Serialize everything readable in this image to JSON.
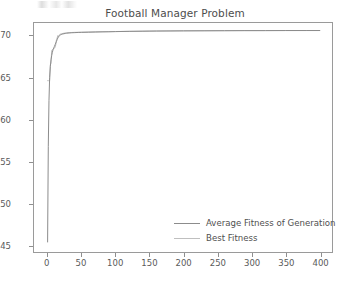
{
  "chart_data": {
    "type": "line",
    "title": "Football Manager Problem",
    "xlabel": "",
    "ylabel": "",
    "xlim": [
      -20,
      418
    ],
    "ylim": [
      44.2,
      71.6
    ],
    "xticks": [
      0,
      50,
      100,
      150,
      200,
      250,
      300,
      350,
      400
    ],
    "yticks": [
      45,
      50,
      55,
      60,
      65,
      70
    ],
    "grid": false,
    "legend_position": "lower right",
    "series": [
      {
        "name": "Average Fitness of Generation",
        "color": "#8c8c8c",
        "x": [
          0,
          1,
          2,
          3,
          4,
          5,
          6,
          7,
          8,
          9,
          10,
          11,
          12,
          13,
          14,
          15,
          16,
          17,
          18,
          19,
          20,
          22,
          24,
          26,
          28,
          30,
          35,
          40,
          45,
          50,
          60,
          70,
          80,
          90,
          100,
          120,
          140,
          160,
          180,
          200,
          230,
          260,
          290,
          320,
          350,
          380,
          400
        ],
        "values": [
          45.4,
          56.8,
          62.3,
          65.1,
          66.4,
          67.2,
          67.7,
          68.1,
          68.4,
          68.6,
          68.8,
          69.0,
          69.2,
          69.4,
          69.6,
          69.8,
          69.95,
          70.05,
          70.12,
          70.18,
          70.22,
          70.28,
          70.32,
          70.35,
          70.38,
          70.4,
          70.43,
          70.45,
          70.47,
          70.48,
          70.5,
          70.52,
          70.54,
          70.55,
          70.57,
          70.6,
          70.62,
          70.64,
          70.65,
          70.66,
          70.67,
          70.68,
          70.69,
          70.69,
          70.7,
          70.7,
          70.7
        ]
      },
      {
        "name": "Best Fitness",
        "color": "#bfbfbf",
        "x": [
          0,
          1,
          2,
          3,
          4,
          5,
          6,
          7,
          8,
          9,
          10,
          11,
          12,
          13,
          14,
          15,
          16,
          17,
          18,
          20,
          24,
          28,
          32,
          40,
          50,
          70,
          100,
          150,
          200,
          260,
          320,
          400
        ],
        "values": [
          64.7,
          64.7,
          64.7,
          64.7,
          66.6,
          66.8,
          68.3,
          68.4,
          68.5,
          68.5,
          68.6,
          68.7,
          69.0,
          69.6,
          69.8,
          70.1,
          70.0,
          70.15,
          70.25,
          70.3,
          70.38,
          70.42,
          70.45,
          70.48,
          70.5,
          70.54,
          70.58,
          70.63,
          70.66,
          70.68,
          70.69,
          70.7
        ]
      }
    ]
  },
  "legend": {
    "items": [
      {
        "label": "Average Fitness of Generation",
        "color": "#8c8c8c"
      },
      {
        "label": "Best Fitness",
        "color": "#bfbfbf"
      }
    ]
  },
  "style": {
    "background": "#ffffff",
    "axis_color": "#9a9a9a",
    "text_color": "#555555"
  }
}
